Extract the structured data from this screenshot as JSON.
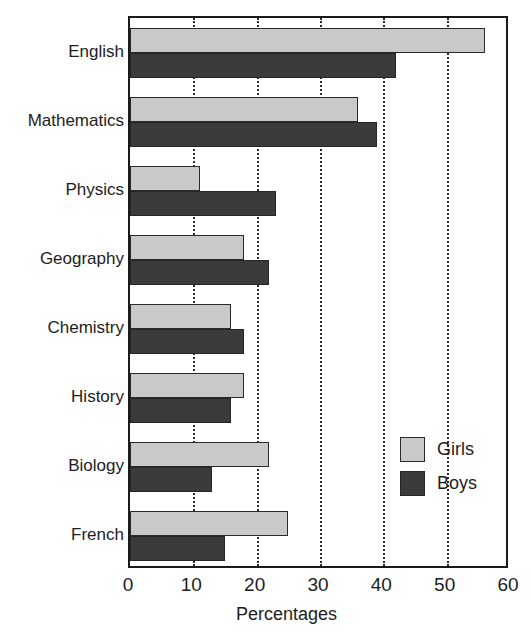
{
  "chart_data": {
    "type": "bar",
    "orientation": "horizontal",
    "title": "",
    "subtitle": "",
    "xlabel": "Percentages",
    "ylabel": "",
    "xlim": [
      0,
      60
    ],
    "xticks": [
      0,
      10,
      20,
      30,
      40,
      50,
      60
    ],
    "xtick_labels": [
      "0",
      "10",
      "20",
      "30",
      "40",
      "50",
      "60"
    ],
    "grid": "vertical-dotted",
    "legend_position": "inside-right-lower",
    "categories": [
      "English",
      "Mathematics",
      "Physics",
      "Geography",
      "Chemistry",
      "History",
      "Biology",
      "French"
    ],
    "series": [
      {
        "name": "Girls",
        "color": "#c9c9c9",
        "values": [
          56,
          36,
          11,
          18,
          16,
          18,
          22,
          25
        ]
      },
      {
        "name": "Boys",
        "color": "#3b3b3b",
        "values": [
          42,
          39,
          23,
          22,
          18,
          16,
          13,
          15
        ]
      }
    ],
    "legend": [
      {
        "label": "Girls",
        "color": "#c9c9c9"
      },
      {
        "label": "Boys",
        "color": "#3b3b3b"
      }
    ],
    "axis_color": "#1a1a1a",
    "gridline_color": "#2b2b2b",
    "background": "#ffffff"
  }
}
